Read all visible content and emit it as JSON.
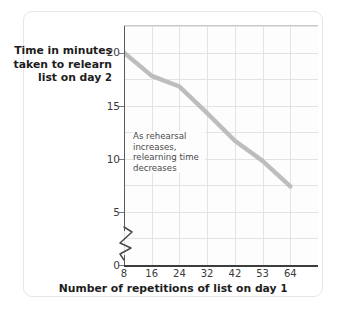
{
  "chart_data": {
    "type": "line",
    "title": "",
    "xlabel": "Number of repetitions of list on day 1",
    "ylabel": "Time in minutes taken to relearn list on day 2",
    "x": [
      8,
      16,
      24,
      32,
      42,
      53,
      64
    ],
    "xtick_labels": [
      "8",
      "16",
      "24",
      "32",
      "42",
      "53",
      "64"
    ],
    "values": [
      20,
      17.8,
      16.8,
      14.3,
      11.7,
      9.8,
      7.4
    ],
    "ytick_labels": [
      "0",
      "5",
      "10",
      "15",
      "20"
    ],
    "yticks": [
      0,
      5,
      10,
      15,
      20
    ],
    "ylim": [
      0,
      22.5
    ],
    "y_axis_break": true,
    "y_axis_break_between": [
      0,
      5
    ],
    "grid": true,
    "grid_h_step": 2.5,
    "legend": "none",
    "annotations": [
      {
        "text_lines": [
          "As rehearsal",
          "increases,",
          "relearning time",
          "decreases"
        ],
        "x": 24,
        "y": 12.5
      }
    ],
    "series_color": "#bdbdbd",
    "grid_color": "#e3e3e3",
    "axis_color": "#4a4a4a"
  },
  "axis_titles": {
    "y_line1": "Time in minutes",
    "y_line2": "taken to relearn",
    "y_line3_a": "list on day ",
    "y_line3_b": "2",
    "x_a": "Number of repetitions of list on day ",
    "x_b": "1"
  },
  "annotation": {
    "l1": "As rehearsal",
    "l2": "increases,",
    "l3": "relearning time",
    "l4": "decreases"
  },
  "ytick_labels": {
    "t0": "0",
    "t5": "5",
    "t10": "10",
    "t15": "15",
    "t20": "20"
  },
  "xtick_labels": {
    "t0": "8",
    "t1": "16",
    "t2": "24",
    "t3": "32",
    "t4": "42",
    "t5": "53",
    "t6": "64"
  }
}
